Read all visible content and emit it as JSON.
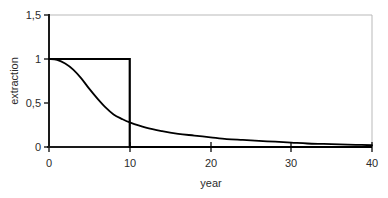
{
  "chart_data": {
    "type": "line",
    "title": "",
    "xlabel": "year",
    "ylabel": "extraction",
    "xlim": [
      0,
      40
    ],
    "ylim": [
      0,
      1.5
    ],
    "grid": false,
    "legend": "none",
    "decimal_separator": ",",
    "xticks": [
      0,
      10,
      20,
      30,
      40
    ],
    "xtick_labels": [
      "0",
      "10",
      "20",
      "30",
      "40"
    ],
    "yticks": [
      0,
      0.5,
      1,
      1.5
    ],
    "ytick_labels": [
      "0",
      "0,5",
      "1",
      "1,5"
    ],
    "series": [
      {
        "name": "step extraction",
        "style": "step",
        "color": "#000000",
        "x": [
          0,
          10,
          10,
          40
        ],
        "values": [
          1,
          1,
          0,
          0
        ]
      },
      {
        "name": "decaying extraction",
        "style": "smooth",
        "color": "#000000",
        "x": [
          0,
          1,
          2,
          3,
          4,
          5,
          6,
          7,
          8,
          9,
          10,
          12,
          14,
          16,
          18,
          20,
          22,
          24,
          26,
          28,
          30,
          32,
          34,
          36,
          38,
          40
        ],
        "values": [
          1.0,
          0.99,
          0.95,
          0.88,
          0.78,
          0.66,
          0.55,
          0.45,
          0.37,
          0.32,
          0.28,
          0.22,
          0.18,
          0.15,
          0.13,
          0.11,
          0.09,
          0.08,
          0.07,
          0.06,
          0.05,
          0.04,
          0.035,
          0.03,
          0.025,
          0.02
        ]
      }
    ]
  },
  "axes": {
    "y_axis_name": "extraction",
    "x_axis_name": "year",
    "y_top_label": "1,5",
    "y_one_label": "1",
    "y_half_label": "0,5",
    "y_zero_label": "0",
    "x0": "0",
    "x10": "10",
    "x20": "20",
    "x30": "30",
    "x40": "40"
  },
  "colors": {
    "series": "#000000",
    "axis": "#1a1a1a",
    "plot_border": "#b9b9b9",
    "background": "#ffffff"
  }
}
